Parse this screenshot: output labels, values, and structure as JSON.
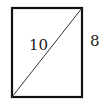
{
  "figure": {
    "shape": "rectangle",
    "diagonal_label": "10",
    "side_label": "8",
    "stroke_color": "#111111",
    "diagonal_color": "#333333"
  }
}
